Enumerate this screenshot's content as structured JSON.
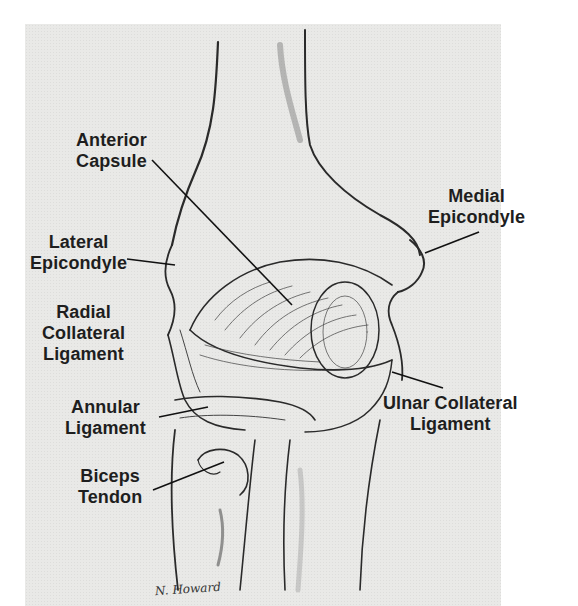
{
  "figure": {
    "labels": {
      "anterior_capsule": [
        "Anterior",
        "Capsule"
      ],
      "medial_epicondyle": [
        "Medial",
        "Epicondyle"
      ],
      "lateral_epicondyle": [
        "Lateral",
        "Epicondyle"
      ],
      "radial_collateral_ligament": [
        "Radial",
        "Collateral",
        "Ligament"
      ],
      "annular_ligament": [
        "Annular",
        "Ligament"
      ],
      "ulnar_collateral_ligament": [
        "Ulnar Collateral",
        "Ligament"
      ],
      "biceps_tendon": [
        "Biceps",
        "Tendon"
      ]
    },
    "signature": "N. Howard"
  }
}
